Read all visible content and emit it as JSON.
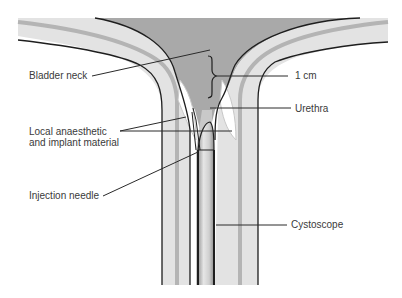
{
  "figure": {
    "type": "anatomical-diagram",
    "colors": {
      "background": "#ffffff",
      "bladder_lumen": "#a9a9a9",
      "wall": "#e3e3e3",
      "wall_stripe": "#b4b4b4",
      "outline": "#1e1e1e",
      "leader": "#2a2a2a",
      "label_text": "#3a3a3a"
    },
    "labels": {
      "bladder_neck": "Bladder neck",
      "one_cm": "1 cm",
      "urethra": "Urethra",
      "local_anaesthetic_line1": "Local anaesthetic",
      "local_anaesthetic_line2": "and implant material",
      "injection_needle": "Injection needle",
      "cystoscope": "Cystoscope"
    }
  }
}
